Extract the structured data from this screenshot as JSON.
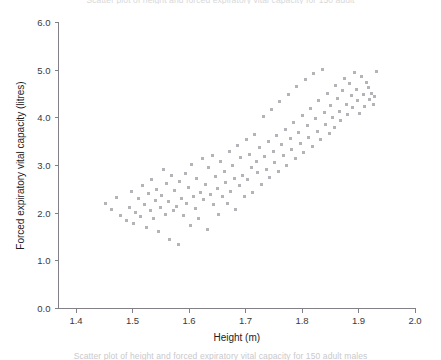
{
  "figure": {
    "top_cut_text": "Scatter plot of height and forced expiratory vital capacity for 150 adult",
    "bottom_cut_text": "Scatter plot of height and forced expiratory vital capacity for 150 adult males"
  },
  "chart_data": {
    "type": "scatter",
    "title": "",
    "subtitle": "",
    "xlabel": "Height (m)",
    "ylabel": "Forced expiratory vital capacity (litres)",
    "xlim": [
      1.35,
      2.0
    ],
    "ylim": [
      0.0,
      6.0
    ],
    "xticks": [
      1.4,
      1.5,
      1.6,
      1.7,
      1.8,
      1.9,
      2.0
    ],
    "xticklabels": [
      "1.4",
      "1.5",
      "1.6",
      "1.7",
      "1.8",
      "1.9",
      "2.0"
    ],
    "yticks": [
      0.0,
      1.0,
      2.0,
      3.0,
      4.0,
      5.0,
      6.0
    ],
    "yticklabels": [
      "0.0",
      "1.0",
      "2.0",
      "3.0",
      "4.0",
      "5.0",
      "6.0"
    ],
    "grid": false,
    "legend": null,
    "marker": {
      "shape": "square",
      "size_px": 3,
      "color": "#b3b3b8"
    },
    "n_points": 150,
    "series": [
      {
        "name": "adult males",
        "x": [
          1.452,
          1.462,
          1.471,
          1.478,
          1.489,
          1.495,
          1.498,
          1.502,
          1.505,
          1.511,
          1.515,
          1.518,
          1.521,
          1.524,
          1.528,
          1.531,
          1.534,
          1.537,
          1.54,
          1.543,
          1.546,
          1.549,
          1.552,
          1.555,
          1.558,
          1.56,
          1.563,
          1.566,
          1.569,
          1.572,
          1.575,
          1.578,
          1.581,
          1.584,
          1.587,
          1.59,
          1.593,
          1.596,
          1.599,
          1.602,
          1.605,
          1.608,
          1.611,
          1.614,
          1.617,
          1.62,
          1.623,
          1.626,
          1.629,
          1.632,
          1.635,
          1.638,
          1.641,
          1.644,
          1.647,
          1.65,
          1.653,
          1.656,
          1.659,
          1.662,
          1.665,
          1.668,
          1.671,
          1.674,
          1.677,
          1.68,
          1.683,
          1.686,
          1.689,
          1.692,
          1.695,
          1.698,
          1.701,
          1.704,
          1.707,
          1.71,
          1.713,
          1.716,
          1.719,
          1.722,
          1.725,
          1.728,
          1.731,
          1.734,
          1.737,
          1.74,
          1.743,
          1.746,
          1.749,
          1.752,
          1.755,
          1.758,
          1.761,
          1.764,
          1.767,
          1.77,
          1.773,
          1.776,
          1.779,
          1.782,
          1.785,
          1.788,
          1.791,
          1.794,
          1.797,
          1.8,
          1.803,
          1.806,
          1.809,
          1.812,
          1.815,
          1.818,
          1.821,
          1.824,
          1.827,
          1.83,
          1.833,
          1.836,
          1.839,
          1.842,
          1.845,
          1.848,
          1.851,
          1.854,
          1.857,
          1.86,
          1.863,
          1.866,
          1.869,
          1.872,
          1.875,
          1.878,
          1.881,
          1.884,
          1.887,
          1.89,
          1.893,
          1.896,
          1.899,
          1.902,
          1.905,
          1.908,
          1.911,
          1.914,
          1.917,
          1.92,
          1.923,
          1.926,
          1.929,
          1.932
        ],
        "y": [
          2.21,
          2.08,
          2.33,
          1.96,
          1.84,
          2.11,
          2.45,
          1.78,
          2.02,
          2.3,
          1.92,
          2.58,
          2.18,
          1.7,
          2.42,
          2.05,
          2.7,
          1.88,
          2.26,
          2.5,
          1.62,
          2.12,
          2.38,
          2.92,
          1.98,
          2.62,
          2.24,
          1.45,
          2.78,
          2.06,
          2.48,
          2.15,
          1.34,
          2.66,
          2.3,
          1.95,
          2.84,
          2.2,
          2.54,
          1.75,
          3.02,
          2.36,
          2.1,
          2.72,
          1.88,
          2.44,
          3.14,
          2.28,
          2.6,
          1.66,
          2.96,
          2.4,
          3.22,
          2.18,
          2.76,
          2.52,
          1.98,
          3.08,
          2.34,
          2.88,
          2.64,
          2.2,
          3.3,
          2.46,
          3.0,
          2.72,
          2.08,
          3.42,
          2.58,
          3.16,
          2.8,
          2.34,
          3.54,
          2.7,
          3.24,
          2.96,
          2.44,
          3.66,
          3.08,
          2.86,
          3.38,
          2.6,
          4.02,
          3.18,
          2.92,
          3.5,
          2.74,
          4.18,
          3.3,
          3.06,
          3.62,
          2.88,
          4.34,
          3.44,
          3.2,
          3.76,
          3.0,
          4.5,
          3.56,
          3.34,
          3.9,
          3.14,
          4.66,
          3.7,
          3.46,
          4.04,
          3.28,
          4.8,
          3.84,
          3.58,
          4.2,
          3.4,
          4.94,
          3.98,
          3.72,
          4.36,
          3.54,
          5.02,
          4.12,
          3.86,
          4.52,
          3.68,
          4.26,
          4.0,
          3.8,
          4.68,
          4.4,
          4.14,
          3.94,
          4.58,
          4.82,
          4.28,
          4.08,
          4.72,
          4.46,
          4.22,
          4.96,
          4.6,
          4.36,
          4.1,
          4.86,
          4.5,
          4.24,
          4.74,
          4.64,
          4.38,
          4.52,
          4.28,
          4.44,
          4.97
        ]
      }
    ]
  }
}
